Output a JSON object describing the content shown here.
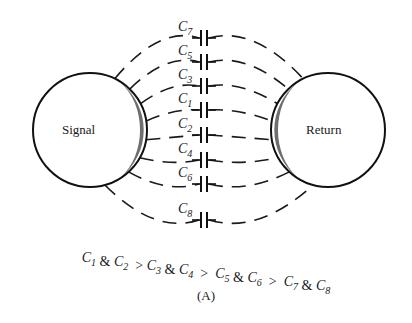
{
  "diagram": {
    "left_conductor": {
      "label": "Signal",
      "cx": 90,
      "cy": 130,
      "r": 57
    },
    "right_conductor": {
      "label": "Return",
      "cx": 328,
      "cy": 130,
      "r": 57
    },
    "shading_color": "#555555",
    "capacitors": [
      {
        "name": "C",
        "sub": "7",
        "y": 38
      },
      {
        "name": "C",
        "sub": "5",
        "y": 62
      },
      {
        "name": "C",
        "sub": "3",
        "y": 86
      },
      {
        "name": "C",
        "sub": "1",
        "y": 110
      },
      {
        "name": "C",
        "sub": "2",
        "y": 135
      },
      {
        "name": "C",
        "sub": "4",
        "y": 160
      },
      {
        "name": "C",
        "sub": "6",
        "y": 184
      },
      {
        "name": "C",
        "sub": "8",
        "y": 220
      }
    ],
    "relation": {
      "parts": [
        {
          "t": "C",
          "s": "1"
        },
        {
          "t": " & "
        },
        {
          "t": "C",
          "s": "2"
        },
        {
          "t": "  > "
        },
        {
          "t": "C",
          "s": "3"
        },
        {
          "t": " & "
        },
        {
          "t": "C",
          "s": "4"
        },
        {
          "t": "  >  "
        },
        {
          "t": "C",
          "s": "5"
        },
        {
          "t": " & "
        },
        {
          "t": "C",
          "s": "6"
        },
        {
          "t": "  >  "
        },
        {
          "t": "C",
          "s": "7"
        },
        {
          "t": " & "
        },
        {
          "t": "C",
          "s": "8"
        }
      ],
      "text": "C1 & C2 > C3 & C4 > C5 & C6 > C7 & C8"
    },
    "caption": "(A)"
  }
}
